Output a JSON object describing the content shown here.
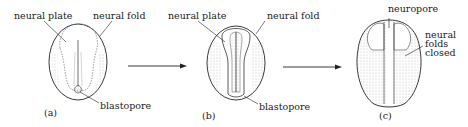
{
  "figure": {
    "stages": [
      {
        "id": "a",
        "caption": "(a)",
        "labels": {
          "neural_plate": "neural plate",
          "neural_fold": "neural fold",
          "blastopore": "blastopore"
        }
      },
      {
        "id": "b",
        "caption": "(b)",
        "labels": {
          "neural_plate": "neural plate",
          "neural_fold": "neural fold",
          "blastopore": "blastopore"
        }
      },
      {
        "id": "c",
        "caption": "(c)",
        "labels": {
          "neuropore": "neuropore",
          "neural_folds_closed": "neural\nfolds\nclosed"
        }
      }
    ],
    "arrows": [
      {
        "from": "a",
        "to": "b"
      },
      {
        "from": "b",
        "to": "c"
      }
    ],
    "colors": {
      "ink": "#222222",
      "stipple": "#9a9a9a",
      "background": "#ffffff"
    }
  }
}
